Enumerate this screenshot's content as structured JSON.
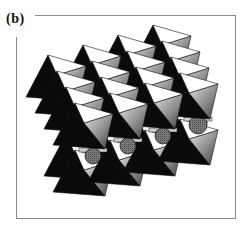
{
  "figure": {
    "label": "(b)",
    "colors": {
      "top_face": "#ffffff",
      "side_face_light": "#d8d8d8",
      "side_face_dark": "#5a5a5a",
      "shadow_face": "#0a0a0a",
      "molecule": "#6e6e6e",
      "frame": "#8a8a8a"
    },
    "upper_layer": {
      "origin": [
        48,
        55
      ],
      "col_step": [
        35,
        -10
      ],
      "row_step": [
        9,
        16
      ],
      "cols": 4,
      "rows": 4
    },
    "lower_layer": {
      "apexes": [
        [
          75,
          150
        ],
        [
          110,
          140
        ],
        [
          145,
          130
        ],
        [
          180,
          119
        ]
      ]
    },
    "molecules": [
      {
        "cx": 93,
        "cy": 156,
        "r": 8
      },
      {
        "cx": 128,
        "cy": 146,
        "r": 8
      },
      {
        "cx": 163,
        "cy": 136,
        "r": 8
      },
      {
        "cx": 198,
        "cy": 125,
        "r": 9
      },
      {
        "cx": 192,
        "cy": 110,
        "r": 7
      }
    ]
  }
}
